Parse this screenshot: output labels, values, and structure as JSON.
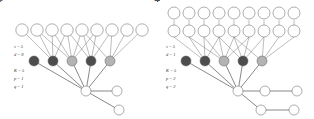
{
  "figure": {
    "background_color": "#ffffff",
    "width": 314,
    "height": 119,
    "edge_color": "#7b7b7b",
    "node_outline_color": "#5d5d5d",
    "node_fill_open": "#ffffff",
    "node_fill_filled": "#4d4d4d",
    "node_fill_shaded": "#b3b3b3"
  },
  "panels": [
    {
      "id": "left",
      "params": [
        {
          "text": "s = 5"
        },
        {
          "text": "d = 0"
        },
        {
          "text": "K = 5"
        },
        {
          "text": "p = 1"
        },
        {
          "text": "q = 1"
        }
      ],
      "layers": {
        "top_rows": [
          {
            "row": 1,
            "nodes": [
              {
                "label": "Ni,1"
              },
              {
                "label": "Ni,1"
              },
              {
                "label": "Ni,1"
              },
              {
                "label": "Ni,1"
              },
              {
                "label": "Ni,1"
              },
              {
                "label": "Ni,1"
              },
              {
                "label": "Ni,1"
              },
              {
                "label": "Ni,1"
              },
              {
                "label": "Ni,1"
              }
            ]
          }
        ],
        "middle": [
          {
            "label": "Si",
            "style": "filled"
          },
          {
            "label": "Si",
            "style": "shaded"
          },
          {
            "label": "Si",
            "style": "filled"
          },
          {
            "label": "Si",
            "style": "shaded"
          },
          {
            "label": "Si",
            "style": "filled"
          }
        ],
        "bottom": [
          {
            "label": "Ri",
            "style": "open"
          }
        ],
        "branches": [
          {
            "label": "Pi",
            "style": "open"
          },
          {
            "label": "Qi",
            "style": "open"
          }
        ]
      }
    },
    {
      "id": "right",
      "params": [
        {
          "text": "s = 5"
        },
        {
          "text": "d = 1"
        },
        {
          "text": "K = 5"
        },
        {
          "text": "p = 2"
        },
        {
          "text": "q = 2"
        }
      ],
      "layers": {
        "top_rows": [
          {
            "row": 2,
            "nodes": [
              {
                "label": "Ni,2"
              },
              {
                "label": "Ni,2"
              },
              {
                "label": "Ni,2"
              },
              {
                "label": "Ni,2"
              },
              {
                "label": "Ni,2"
              },
              {
                "label": "Ni,2"
              },
              {
                "label": "Ni,2"
              },
              {
                "label": "Ni,2"
              },
              {
                "label": "Ni,2"
              }
            ]
          },
          {
            "row": 1,
            "nodes": [
              {
                "label": "Ni,1"
              },
              {
                "label": "Ni,1"
              },
              {
                "label": "Ni,1"
              },
              {
                "label": "Ni,1"
              },
              {
                "label": "Ni,1"
              },
              {
                "label": "Ni,1"
              },
              {
                "label": "Ni,1"
              },
              {
                "label": "Ni,1"
              },
              {
                "label": "Ni,1"
              }
            ]
          }
        ],
        "middle": [
          {
            "label": "Si",
            "style": "filled"
          },
          {
            "label": "Si",
            "style": "shaded"
          },
          {
            "label": "Si",
            "style": "filled"
          },
          {
            "label": "Si",
            "style": "shaded"
          },
          {
            "label": "Si",
            "style": "filled"
          }
        ],
        "bottom": [
          {
            "label": "Ri",
            "style": "open"
          }
        ],
        "branches": [
          {
            "label": "Pi",
            "style": "open"
          },
          {
            "label": "Pi",
            "style": "open"
          },
          {
            "label": "Qi",
            "style": "open"
          },
          {
            "label": "Qi",
            "style": "open"
          }
        ]
      }
    }
  ]
}
